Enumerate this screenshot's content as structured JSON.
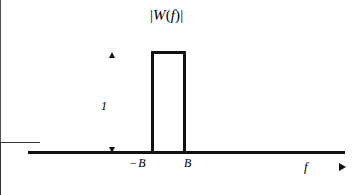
{
  "figure": {
    "background_color": "#ffffff",
    "stroke_color": "#111111",
    "axis_color": "#555555",
    "title": "|W(f)|",
    "title_parts": {
      "bar_open": "|",
      "function_name": "W",
      "paren_open": "(",
      "variable": "f",
      "paren_close": ")",
      "bar_close": "|"
    },
    "amplitude_label": "1",
    "negative_bandwidth_sign": "−",
    "negative_bandwidth_label": "B",
    "positive_bandwidth_label": "B",
    "frequency_axis_label": "f"
  },
  "chart_data": {
    "type": "line",
    "title": "|W(f)|",
    "xlabel": "f",
    "ylabel": "|W(f)|",
    "series": [
      {
        "name": "|W(f)|",
        "x": [
          "-inf",
          "-B",
          "-B",
          "B",
          "B",
          "+inf"
        ],
        "y": [
          0,
          0,
          1,
          1,
          0,
          0
        ]
      }
    ],
    "x_tick_labels": [
      "− B",
      "B"
    ],
    "x_tick_values": [
      -1,
      1
    ],
    "y_tick_labels": [
      "1"
    ],
    "y_tick_values": [
      1
    ],
    "ylim": [
      0,
      1.25
    ],
    "xlim": [
      -4.4,
      5.5
    ],
    "grid": false,
    "legend": "none",
    "annotations": [
      {
        "name": "amplitude-dimension",
        "text": "1",
        "style": "double-headed vertical arrow spanning from the baseline to the passband plateau"
      },
      {
        "name": "frequency-axis-direction",
        "text": "f",
        "style": "italic label followed by a rightward arrow at the end of the horizontal axis"
      }
    ]
  }
}
